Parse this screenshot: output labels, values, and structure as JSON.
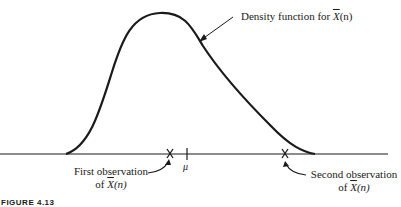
{
  "figure": {
    "caption": "FIGURE 4.13",
    "curve_label": {
      "prefix": "Density function for ",
      "var": "X",
      "arg": "(n)"
    },
    "mu_label": "μ",
    "first_obs": {
      "line1": "First observation",
      "line2_prefix": "of ",
      "var": "X",
      "arg": "(n)"
    },
    "second_obs": {
      "line1": "Second observation",
      "line2_prefix": "of ",
      "var": "X",
      "arg": "(n)"
    },
    "colors": {
      "ink": "#1a1a1a",
      "background": "#ffffff"
    }
  }
}
